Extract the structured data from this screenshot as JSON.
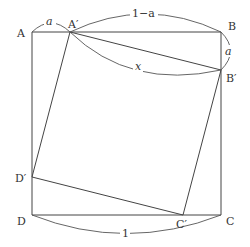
{
  "diagram": {
    "title": "",
    "colors": {
      "stroke": "#444444",
      "text": "#333333",
      "background": "#ffffff"
    },
    "vertices": {
      "A": {
        "label": "A",
        "x": 32,
        "y": 32
      },
      "B": {
        "label": "B",
        "x": 221,
        "y": 32
      },
      "C": {
        "label": "C",
        "x": 221,
        "y": 215
      },
      "D": {
        "label": "D",
        "x": 32,
        "y": 215
      },
      "A2": {
        "label": "A′",
        "x": 70,
        "y": 32
      },
      "B2": {
        "label": "B′",
        "x": 221,
        "y": 70
      },
      "C2": {
        "label": "C′",
        "x": 183,
        "y": 215
      },
      "D2": {
        "label": "D′",
        "x": 32,
        "y": 177
      }
    },
    "measures": {
      "AA2": "a",
      "A2B": "1−a",
      "BB2": "a",
      "A2B2": "x",
      "DC": "1"
    }
  }
}
